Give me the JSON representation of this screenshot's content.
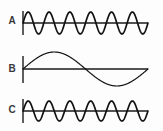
{
  "figure": {
    "background_color": "#fdfdfd",
    "stroke_color": "#111111",
    "label_color": "#3a3a3a",
    "width": 163,
    "height": 131
  },
  "traces": [
    {
      "label": "A",
      "name": "high-frequency-waveform-a",
      "waveform": "sine",
      "cycles": 6,
      "amplitude": 11,
      "baseline_y": 23,
      "x_start": 23,
      "x_end": 148,
      "phase": "positive-first",
      "description": "Six-cycle sine wave of moderate amplitude on a horizontal axis"
    },
    {
      "label": "B",
      "name": "low-frequency-waveform-b",
      "waveform": "sine",
      "cycles": 1,
      "amplitude": 17,
      "baseline_y": 69,
      "x_start": 23,
      "x_end": 148,
      "phase": "positive-first",
      "description": "Single-cycle sine wave of large amplitude on a horizontal axis"
    },
    {
      "label": "C",
      "name": "high-frequency-waveform-c",
      "waveform": "sine",
      "cycles": 6,
      "amplitude": 10,
      "baseline_y": 111,
      "x_start": 23,
      "x_end": 148,
      "phase": "positive-first",
      "description": "Six-cycle sine wave of moderate amplitude on a horizontal axis"
    }
  ],
  "axis": {
    "tick_half_height": 12,
    "tick_x": 23,
    "line_width": 1.6
  },
  "chart_data": {
    "type": "line",
    "xlabel": "",
    "ylabel": "",
    "grid": false,
    "legend": "none",
    "series": [
      {
        "name": "A",
        "function": "sin",
        "cycles": 6,
        "amplitude": 11,
        "baseline": 0
      },
      {
        "name": "B",
        "function": "sin",
        "cycles": 1,
        "amplitude": 17,
        "baseline": 0
      },
      {
        "name": "C",
        "function": "sin",
        "cycles": 6,
        "amplitude": 10,
        "baseline": 0
      }
    ]
  }
}
